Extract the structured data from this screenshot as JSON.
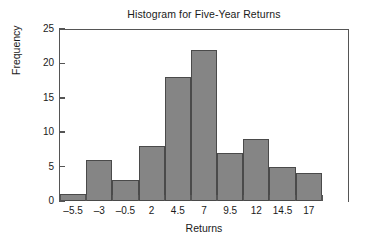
{
  "chart_data": {
    "type": "bar",
    "title": "Histogram for Five-Year Returns",
    "xlabel": "Returns",
    "ylabel": "Frequency",
    "categories": [
      "–5.5",
      "–3",
      "–0.5",
      "2",
      "4.5",
      "7",
      "9.5",
      "12",
      "14.5",
      "17"
    ],
    "values": [
      1,
      6,
      3,
      8,
      18,
      22,
      7,
      9,
      5,
      4
    ],
    "ylim": [
      0,
      25
    ],
    "yticks": [
      "0",
      "5",
      "10",
      "15",
      "20",
      "25"
    ],
    "ytick_values": [
      0,
      5,
      10,
      15,
      20,
      25
    ],
    "grid": false,
    "legend": false,
    "bar_fill_color": "#858585",
    "bar_edge_color": "#4a4a4a",
    "axis_color": "#555555",
    "text_color": "#1a1a1a",
    "background_color": "#ffffff"
  }
}
